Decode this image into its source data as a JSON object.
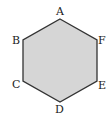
{
  "diagram": {
    "shape": "regular hexagon",
    "fill_color": "#d6d6d6",
    "stroke_color": "#333333",
    "vertices": [
      {
        "label": "A",
        "x": 60,
        "y": 19
      },
      {
        "label": "F",
        "x": 97,
        "y": 40
      },
      {
        "label": "E",
        "x": 97,
        "y": 81
      },
      {
        "label": "D",
        "x": 60,
        "y": 102
      },
      {
        "label": "C",
        "x": 23,
        "y": 81
      },
      {
        "label": "B",
        "x": 23,
        "y": 40
      }
    ],
    "labels": {
      "A": "A",
      "B": "B",
      "C": "C",
      "D": "D",
      "E": "E",
      "F": "F"
    }
  }
}
